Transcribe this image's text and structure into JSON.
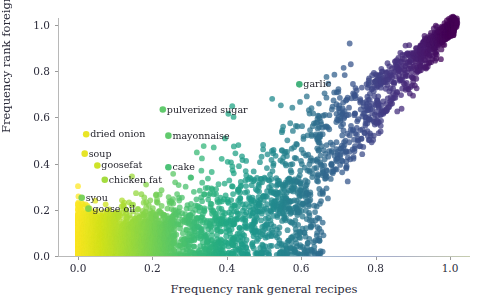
{
  "figure": {
    "width": 485,
    "height": 306,
    "background": "#ffffff"
  },
  "chart_data": {
    "type": "scatter",
    "title": "",
    "xlabel": "Frequency rank general recipes",
    "ylabel": "Frequency rank foreign recipes",
    "xlim": [
      -0.03,
      1.06
    ],
    "ylim": [
      -0.04,
      1.06
    ],
    "xticks": [
      "0.0",
      "0.2",
      "0.4",
      "0.6",
      "0.8",
      "1.0"
    ],
    "xtick_values": [
      0.0,
      0.2,
      0.4,
      0.6,
      0.8,
      1.0
    ],
    "yticks": [
      "0.0",
      "0.2",
      "0.4",
      "0.6",
      "0.8",
      "1.0"
    ],
    "ytick_values": [
      0.0,
      0.2,
      0.4,
      0.6,
      0.8,
      1.0
    ],
    "grid": false,
    "legend": null,
    "colormap": "viridis",
    "colormap_variable": "x",
    "marker_size": 22,
    "marker_alpha": 0.75,
    "annotations": [
      {
        "label": "dried onion",
        "x": 0.022,
        "y": 0.527,
        "color": "#e8e419"
      },
      {
        "label": "soup",
        "x": 0.018,
        "y": 0.443,
        "color": "#e5e31c"
      },
      {
        "label": "goosefat",
        "x": 0.052,
        "y": 0.392,
        "color": "#cbe11e"
      },
      {
        "label": "chicken fat",
        "x": 0.072,
        "y": 0.33,
        "color": "#9fda35"
      },
      {
        "label": "syou",
        "x": 0.01,
        "y": 0.252,
        "color": "#73d055"
      },
      {
        "label": "goose oil",
        "x": 0.028,
        "y": 0.205,
        "color": "#80d24b"
      },
      {
        "label": "cake",
        "x": 0.243,
        "y": 0.384,
        "color": "#43bf70"
      },
      {
        "label": "mayonnaise",
        "x": 0.243,
        "y": 0.521,
        "color": "#58c765"
      },
      {
        "label": "pulverized sugar",
        "x": 0.228,
        "y": 0.634,
        "color": "#d7e११9"
      },
      {
        "label": "garlic",
        "x": 0.595,
        "y": 0.743,
        "color": "#3aae76"
      }
    ]
  }
}
